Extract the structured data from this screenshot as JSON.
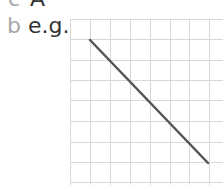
{
  "items": [
    {
      "letter": "c",
      "text": "A"
    },
    {
      "letter": "b",
      "text": "e.g."
    }
  ],
  "diagram": {
    "type": "grid-with-line",
    "grid": {
      "columns": 7,
      "rows": 8,
      "cell_px": 20.3,
      "line_color": "#d8d8d8"
    },
    "line": {
      "from_cell": [
        1,
        1
      ],
      "to_cell": [
        7,
        7
      ],
      "color": "#555555",
      "description": "straight line with negative slope"
    }
  }
}
